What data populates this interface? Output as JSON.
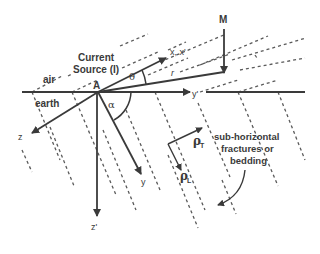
{
  "diagram": {
    "title": "",
    "colors": {
      "line": "#3a3a3a",
      "dashed": "#5a5a5a",
      "background": "#ffffff"
    },
    "labels": {
      "current_source_line1": "Current",
      "current_source_line2": "Source (I)",
      "air": "air",
      "earth": "earth",
      "point_a": "A",
      "point_m": "M",
      "axis_x": "x, x'",
      "axis_y_prime": "y'",
      "axis_y": "y",
      "axis_z": "z",
      "axis_z_prime": "z'",
      "radius": "r",
      "theta": "θ",
      "alpha": "α",
      "rho_t": "ρ",
      "rho_t_sub": "T",
      "rho_l": "ρ",
      "rho_l_sub": "L",
      "fractures_line1": "sub-horizontal",
      "fractures_line2": "fractures or",
      "fractures_line3": "bedding"
    },
    "nodes": [
      {
        "id": "A",
        "label": "A",
        "role": "current source point at surface"
      },
      {
        "id": "M",
        "label": "M",
        "role": "measurement point"
      }
    ],
    "edges": [
      {
        "from": "A",
        "to": "x, x'",
        "type": "arrow"
      },
      {
        "from": "A",
        "to": "y'",
        "type": "arrow"
      },
      {
        "from": "A",
        "to": "y",
        "type": "arrow"
      },
      {
        "from": "A",
        "to": "z",
        "type": "arrow"
      },
      {
        "from": "A",
        "to": "z'",
        "type": "arrow"
      },
      {
        "from": "A",
        "to": "M",
        "type": "line",
        "label": "r"
      },
      {
        "from": "M",
        "to": "r-end",
        "type": "arrow"
      }
    ]
  }
}
